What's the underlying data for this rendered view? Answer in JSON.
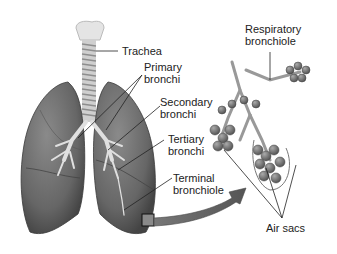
{
  "figure": {
    "labels": {
      "trachea": "Trachea",
      "primary_bronchi": [
        "Primary",
        "bronchi"
      ],
      "secondary_bronchi": [
        "Secondary",
        "bronchi"
      ],
      "tertiary_bronchi": [
        "Tertiary",
        "bronchi"
      ],
      "terminal_bronchiole": [
        "Terminal",
        "bronchiole"
      ],
      "respiratory_bronchiole": [
        "Respiratory",
        "bronchiole"
      ],
      "air_sacs": "Air sacs"
    },
    "colors": {
      "lung_fill": "#6e6e6e",
      "lung_shadow": "#4a4a4a",
      "airway": "#d8d8d8",
      "alveoli": "#7a7a7a",
      "leader_line": "#222222",
      "background": "#ffffff"
    }
  }
}
